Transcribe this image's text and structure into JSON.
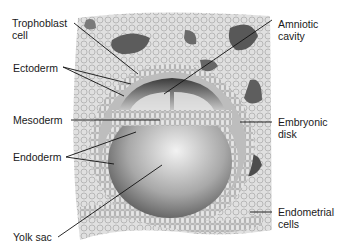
{
  "diagram": {
    "labels": {
      "trophoblast": "Trophoblast\ncell",
      "ectoderm": "Ectoderm",
      "mesoderm": "Mesoderm",
      "endoderm": "Endoderm",
      "yolk_sac": "Yolk sac",
      "amniotic_cavity": "Amniotic\ncavity",
      "embryonic_disk": "Embryonic\ndisk",
      "endometrial": "Endometrial\ncells"
    }
  }
}
